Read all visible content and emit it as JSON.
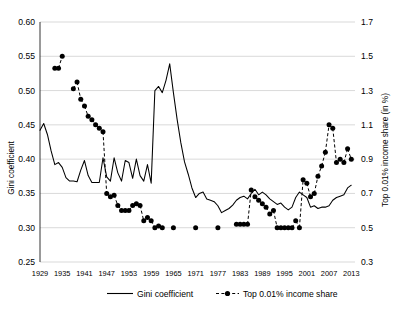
{
  "chart_data": {
    "type": "line",
    "title": "",
    "subtitle": "",
    "xlabel": "",
    "ylabel": "Gini coefficient",
    "y2label": "Top 0.01% income share (in %)",
    "grid": true,
    "legend_position": "bottom",
    "xlim": [
      1929,
      2014
    ],
    "ylim": [
      0.25,
      0.6
    ],
    "y2lim": [
      0.3,
      1.7
    ],
    "xticks": [
      1929,
      1935,
      1941,
      1947,
      1953,
      1959,
      1965,
      1971,
      1977,
      1983,
      1989,
      1995,
      2001,
      2007,
      2013
    ],
    "yticks": [
      0.25,
      0.3,
      0.35,
      0.4,
      0.45,
      0.5,
      0.55,
      0.6
    ],
    "ytick_labels": [
      "0.25",
      "0.30",
      "0.35",
      "0.40",
      "0.45",
      "0.50",
      "0.55",
      "0.60"
    ],
    "y2ticks": [
      0.3,
      0.5,
      0.7,
      0.9,
      1.1,
      1.3,
      1.5,
      1.7
    ],
    "y2tick_labels": [
      "0.3",
      "0.5",
      "0.7",
      "0.9",
      "1.1",
      "1.3",
      "1.5",
      "1.7"
    ],
    "series": [
      {
        "name": "Gini coefficient",
        "axis": "left",
        "style": "solid-line",
        "marker": "none",
        "color": "#000000",
        "x": [
          1929,
          1930,
          1931,
          1932,
          1933,
          1934,
          1935,
          1936,
          1937,
          1938,
          1939,
          1940,
          1941,
          1942,
          1943,
          1944,
          1945,
          1946,
          1947,
          1948,
          1949,
          1950,
          1951,
          1952,
          1953,
          1954,
          1955,
          1956,
          1957,
          1958,
          1959,
          1960,
          1961,
          1962,
          1963,
          1964,
          1965,
          1966,
          1967,
          1968,
          1969,
          1970,
          1971,
          1972,
          1973,
          1974,
          1975,
          1976,
          1977,
          1978,
          1979,
          1980,
          1981,
          1982,
          1983,
          1984,
          1985,
          1986,
          1987,
          1988,
          1989,
          1990,
          1991,
          1992,
          1993,
          1994,
          1995,
          1996,
          1997,
          1998,
          1999,
          2000,
          2001,
          2002,
          2003,
          2004,
          2005,
          2006,
          2007,
          2008,
          2009,
          2010,
          2011,
          2012,
          2013
        ],
        "y": [
          0.442,
          0.452,
          0.436,
          0.412,
          0.392,
          0.395,
          0.388,
          0.373,
          0.368,
          0.368,
          0.367,
          0.384,
          0.398,
          0.376,
          0.366,
          0.366,
          0.366,
          0.402,
          0.374,
          0.368,
          0.402,
          0.38,
          0.368,
          0.398,
          0.395,
          0.372,
          0.4,
          0.376,
          0.368,
          0.392,
          0.365,
          0.5,
          0.506,
          0.497,
          0.515,
          0.539,
          0.497,
          0.458,
          0.424,
          0.396,
          0.378,
          0.358,
          0.344,
          0.35,
          0.352,
          0.342,
          0.34,
          0.338,
          0.332,
          0.322,
          0.325,
          0.328,
          0.333,
          0.34,
          0.344,
          0.346,
          0.342,
          0.35,
          0.356,
          0.348,
          0.352,
          0.348,
          0.342,
          0.338,
          0.334,
          0.336,
          0.33,
          0.326,
          0.33,
          0.344,
          0.352,
          0.348,
          0.344,
          0.33,
          0.332,
          0.328,
          0.33,
          0.33,
          0.332,
          0.34,
          0.344,
          0.346,
          0.348,
          0.358,
          0.362
        ]
      },
      {
        "name": "Top 0.01% income share",
        "axis": "right",
        "style": "dashed-line-with-markers",
        "marker": "filled-circle",
        "color": "#000000",
        "x": [
          1933,
          1934,
          1935,
          1938,
          1939,
          1940,
          1941,
          1942,
          1943,
          1944,
          1945,
          1946,
          1947,
          1948,
          1949,
          1950,
          1951,
          1952,
          1953,
          1954,
          1955,
          1956,
          1957,
          1958,
          1959,
          1960,
          1961,
          1962,
          1965,
          1971,
          1977,
          1982,
          1983,
          1984,
          1985,
          1986,
          1987,
          1988,
          1989,
          1990,
          1991,
          1992,
          1993,
          1994,
          1995,
          1996,
          1997,
          1998,
          1999,
          2000,
          2001,
          2002,
          2003,
          2004,
          2005,
          2006,
          2007,
          2008,
          2009,
          2010,
          2011,
          2012,
          2013
        ],
        "y": [
          1.43,
          1.43,
          1.5,
          1.31,
          1.35,
          1.25,
          1.21,
          1.15,
          1.13,
          1.1,
          1.08,
          1.06,
          0.7,
          0.68,
          0.69,
          0.63,
          0.6,
          0.6,
          0.6,
          0.63,
          0.64,
          0.63,
          0.54,
          0.56,
          0.54,
          0.5,
          0.51,
          0.5,
          0.5,
          0.5,
          0.5,
          0.52,
          0.52,
          0.52,
          0.52,
          0.72,
          0.68,
          0.66,
          0.64,
          0.62,
          0.58,
          0.6,
          0.5,
          0.5,
          0.5,
          0.5,
          0.5,
          0.54,
          0.5,
          0.78,
          0.76,
          0.68,
          0.7,
          0.8,
          0.86,
          0.94,
          1.1,
          1.08,
          0.88,
          0.9,
          0.88,
          0.96,
          0.9
        ]
      }
    ],
    "legend": [
      {
        "label": "Gini coefficient",
        "style": "solid-line"
      },
      {
        "label": "Top 0.01% income share",
        "style": "dashed-line-with-marker"
      }
    ]
  }
}
